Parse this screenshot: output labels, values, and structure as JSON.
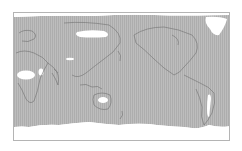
{
  "map": {
    "projection": "pacific-centered equirectangular world map",
    "colors": {
      "shaded": "#b9b9b9",
      "hatch": "#a9a9a9",
      "unshaded": "#ffffff",
      "coastline": "#6e6e6e",
      "frame": "#b4b4b4"
    },
    "shaded_label": "shaded region",
    "unshaded_regions": [
      "Sahara / North Africa",
      "Arabian Peninsula",
      "Tibet / Himalaya",
      "Central Asia / Siberia band",
      "Central Australia",
      "Greenland",
      "Arctic fringe",
      "Andes / Atacama",
      "Antarctica / Southern Ocean"
    ]
  }
}
